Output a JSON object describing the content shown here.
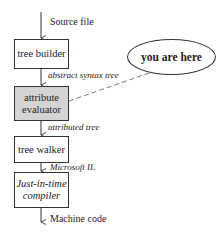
{
  "diagram": {
    "input_label": "Source file",
    "output_label": "Machine code",
    "stages": [
      {
        "name": "tree builder",
        "line1": "tree builder",
        "line2": "",
        "style": "plain"
      },
      {
        "name": "attribute evaluator",
        "line1": "attribute",
        "line2": "evaluator",
        "style": "shaded"
      },
      {
        "name": "tree walker",
        "line1": "tree walker",
        "line2": "",
        "style": "plain"
      },
      {
        "name": "Just-in-time compiler",
        "line1": "Just-in-time",
        "line2": "compiler",
        "style": "italic"
      }
    ],
    "edges": [
      {
        "label": "abstract syntax tree"
      },
      {
        "label": "attributed tree"
      },
      {
        "label": "Microsoft IL"
      }
    ],
    "callout": {
      "text": "you are here",
      "points_to": "attribute evaluator"
    },
    "colors": {
      "stroke": "#333333",
      "highlight_fill": "#d4d4d4",
      "background": "#ffffff"
    }
  }
}
